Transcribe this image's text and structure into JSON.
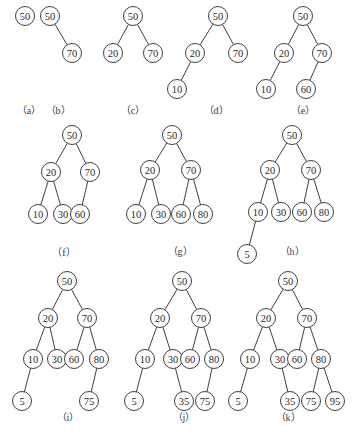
{
  "diagram": {
    "style": {
      "stroke": "#2a2a2a",
      "text": "#2a2a2a",
      "label": "#3a3a3a",
      "radius": 9.5
    },
    "panels": [
      {
        "id": "a",
        "label": "（a）",
        "label_pos": [
          29,
          114
        ],
        "nodes": [
          {
            "v": "50",
            "x": 25,
            "y": 16
          }
        ],
        "edges": []
      },
      {
        "id": "b",
        "label": "（b）",
        "label_pos": [
          58,
          114
        ],
        "nodes": [
          {
            "v": "50",
            "x": 50,
            "y": 16
          },
          {
            "v": "70",
            "x": 72,
            "y": 53
          }
        ],
        "edges": [
          [
            0,
            1
          ]
        ]
      },
      {
        "id": "c",
        "label": "（c）",
        "label_pos": [
          133,
          114
        ],
        "nodes": [
          {
            "v": "50",
            "x": 133,
            "y": 16
          },
          {
            "v": "20",
            "x": 113,
            "y": 53
          },
          {
            "v": "70",
            "x": 153,
            "y": 53
          }
        ],
        "edges": [
          [
            0,
            1
          ],
          [
            0,
            2
          ]
        ]
      },
      {
        "id": "d",
        "label": "（d）",
        "label_pos": [
          216,
          114
        ],
        "nodes": [
          {
            "v": "50",
            "x": 218,
            "y": 16
          },
          {
            "v": "20",
            "x": 195,
            "y": 53
          },
          {
            "v": "70",
            "x": 238,
            "y": 53
          },
          {
            "v": "10",
            "x": 177,
            "y": 89
          }
        ],
        "edges": [
          [
            0,
            1
          ],
          [
            0,
            2
          ],
          [
            1,
            3
          ]
        ]
      },
      {
        "id": "e",
        "label": "（e）",
        "label_pos": [
          303,
          114
        ],
        "nodes": [
          {
            "v": "50",
            "x": 303,
            "y": 16
          },
          {
            "v": "20",
            "x": 284,
            "y": 53
          },
          {
            "v": "70",
            "x": 322,
            "y": 53
          },
          {
            "v": "10",
            "x": 266,
            "y": 89
          },
          {
            "v": "60",
            "x": 306,
            "y": 89
          }
        ],
        "edges": [
          [
            0,
            1
          ],
          [
            0,
            2
          ],
          [
            1,
            3
          ],
          [
            2,
            4
          ]
        ]
      },
      {
        "id": "f",
        "label": "（f）",
        "label_pos": [
          64,
          256
        ],
        "nodes": [
          {
            "v": "50",
            "x": 72,
            "y": 135
          },
          {
            "v": "20",
            "x": 51,
            "y": 172
          },
          {
            "v": "70",
            "x": 90,
            "y": 172
          },
          {
            "v": "10",
            "x": 38,
            "y": 214
          },
          {
            "v": "30",
            "x": 63,
            "y": 214
          },
          {
            "v": "60",
            "x": 80,
            "y": 214
          }
        ],
        "edges": [
          [
            0,
            1
          ],
          [
            0,
            2
          ],
          [
            1,
            3
          ],
          [
            1,
            4
          ],
          [
            2,
            5
          ]
        ]
      },
      {
        "id": "g",
        "label": "（g）",
        "label_pos": [
          180,
          255
        ],
        "nodes": [
          {
            "v": "50",
            "x": 172,
            "y": 135
          },
          {
            "v": "20",
            "x": 150,
            "y": 170
          },
          {
            "v": "70",
            "x": 191,
            "y": 170
          },
          {
            "v": "10",
            "x": 136,
            "y": 214
          },
          {
            "v": "30",
            "x": 161,
            "y": 214
          },
          {
            "v": "60",
            "x": 181,
            "y": 214
          },
          {
            "v": "80",
            "x": 203,
            "y": 214
          }
        ],
        "edges": [
          [
            0,
            1
          ],
          [
            0,
            2
          ],
          [
            1,
            3
          ],
          [
            1,
            4
          ],
          [
            2,
            5
          ],
          [
            2,
            6
          ]
        ]
      },
      {
        "id": "h",
        "label": "（h）",
        "label_pos": [
          292,
          255
        ],
        "nodes": [
          {
            "v": "50",
            "x": 292,
            "y": 135
          },
          {
            "v": "20",
            "x": 270,
            "y": 170
          },
          {
            "v": "70",
            "x": 311,
            "y": 170
          },
          {
            "v": "10",
            "x": 258,
            "y": 212
          },
          {
            "v": "30",
            "x": 281,
            "y": 212
          },
          {
            "v": "60",
            "x": 302,
            "y": 212
          },
          {
            "v": "80",
            "x": 324,
            "y": 212
          },
          {
            "v": "5",
            "x": 247,
            "y": 254
          }
        ],
        "edges": [
          [
            0,
            1
          ],
          [
            0,
            2
          ],
          [
            1,
            3
          ],
          [
            1,
            4
          ],
          [
            2,
            5
          ],
          [
            2,
            6
          ],
          [
            3,
            7
          ]
        ]
      },
      {
        "id": "i",
        "label": "（i）",
        "label_pos": [
          68,
          421
        ],
        "nodes": [
          {
            "v": "50",
            "x": 67,
            "y": 281
          },
          {
            "v": "20",
            "x": 48,
            "y": 318
          },
          {
            "v": "70",
            "x": 87,
            "y": 318
          },
          {
            "v": "10",
            "x": 33,
            "y": 359
          },
          {
            "v": "30",
            "x": 57,
            "y": 359
          },
          {
            "v": "60",
            "x": 74,
            "y": 359
          },
          {
            "v": "80",
            "x": 99,
            "y": 359
          },
          {
            "v": "5",
            "x": 22,
            "y": 401
          },
          {
            "v": "75",
            "x": 89,
            "y": 401
          }
        ],
        "edges": [
          [
            0,
            1
          ],
          [
            0,
            2
          ],
          [
            1,
            3
          ],
          [
            1,
            4
          ],
          [
            2,
            5
          ],
          [
            2,
            6
          ],
          [
            3,
            7
          ],
          [
            6,
            8
          ]
        ]
      },
      {
        "id": "j",
        "label": "（j）",
        "label_pos": [
          184,
          421
        ],
        "nodes": [
          {
            "v": "50",
            "x": 182,
            "y": 281
          },
          {
            "v": "20",
            "x": 160,
            "y": 318
          },
          {
            "v": "70",
            "x": 201,
            "y": 318
          },
          {
            "v": "10",
            "x": 145,
            "y": 359
          },
          {
            "v": "30",
            "x": 173,
            "y": 359
          },
          {
            "v": "60",
            "x": 190,
            "y": 359
          },
          {
            "v": "80",
            "x": 214,
            "y": 359
          },
          {
            "v": "5",
            "x": 134,
            "y": 401
          },
          {
            "v": "35",
            "x": 184,
            "y": 401
          },
          {
            "v": "75",
            "x": 205,
            "y": 401
          }
        ],
        "edges": [
          [
            0,
            1
          ],
          [
            0,
            2
          ],
          [
            1,
            3
          ],
          [
            1,
            4
          ],
          [
            2,
            5
          ],
          [
            2,
            6
          ],
          [
            3,
            7
          ],
          [
            4,
            8
          ],
          [
            6,
            9
          ]
        ]
      },
      {
        "id": "k",
        "label": "（k）",
        "label_pos": [
          288,
          421
        ],
        "nodes": [
          {
            "v": "50",
            "x": 288,
            "y": 281
          },
          {
            "v": "20",
            "x": 266,
            "y": 318
          },
          {
            "v": "70",
            "x": 307,
            "y": 318
          },
          {
            "v": "10",
            "x": 250,
            "y": 359
          },
          {
            "v": "30",
            "x": 280,
            "y": 359
          },
          {
            "v": "60",
            "x": 297,
            "y": 359
          },
          {
            "v": "80",
            "x": 321,
            "y": 359
          },
          {
            "v": "5",
            "x": 238,
            "y": 401
          },
          {
            "v": "35",
            "x": 290,
            "y": 401
          },
          {
            "v": "75",
            "x": 311,
            "y": 401
          },
          {
            "v": "95",
            "x": 335,
            "y": 401
          }
        ],
        "edges": [
          [
            0,
            1
          ],
          [
            0,
            2
          ],
          [
            1,
            3
          ],
          [
            1,
            4
          ],
          [
            2,
            5
          ],
          [
            2,
            6
          ],
          [
            3,
            7
          ],
          [
            4,
            8
          ],
          [
            6,
            9
          ],
          [
            6,
            10
          ]
        ]
      }
    ]
  }
}
